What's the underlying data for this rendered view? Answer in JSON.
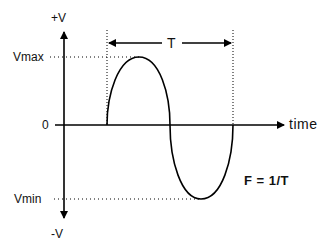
{
  "diagram": {
    "labels": {
      "plus_v": "+V",
      "minus_v": "-V",
      "vmax": "Vmax",
      "vmin": "Vmin",
      "zero": "0",
      "time": "time",
      "period": "T",
      "formula": "F = 1/T"
    },
    "elements": [
      {
        "id": "y-axis",
        "type": "double-arrow",
        "label_top": "+V",
        "label_bottom": "-V"
      },
      {
        "id": "x-axis",
        "type": "arrow",
        "label": "time"
      },
      {
        "id": "sine-wave",
        "type": "curve",
        "cycles": 1
      },
      {
        "id": "vmax-guide",
        "type": "dotted-line",
        "label": "Vmax"
      },
      {
        "id": "vmin-guide",
        "type": "dotted-line",
        "label": "Vmin"
      },
      {
        "id": "period-arrow",
        "type": "double-arrow",
        "label": "T"
      },
      {
        "id": "formula",
        "type": "text",
        "label": "F = 1/T"
      }
    ],
    "colors": {
      "stroke": "#000000",
      "background": "#ffffff"
    }
  }
}
